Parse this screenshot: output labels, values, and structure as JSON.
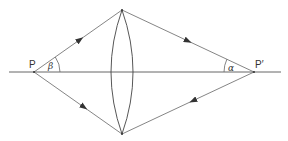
{
  "diagram": {
    "type": "ray-optics",
    "colors": {
      "line": "#555555",
      "background": "#ffffff"
    },
    "labels": {
      "object_point": "P",
      "image_point": "P′",
      "angle_object": "β",
      "angle_image": "α"
    },
    "elements": {
      "optical_axis": {
        "x1": 9,
        "y1": 72,
        "x2": 281,
        "y2": 72
      },
      "lens": {
        "cx": 122,
        "top": 10,
        "bottom": 134,
        "half_width": 11
      },
      "P": {
        "x": 34,
        "y": 72
      },
      "P_prime": {
        "x": 254,
        "y": 72
      }
    }
  }
}
